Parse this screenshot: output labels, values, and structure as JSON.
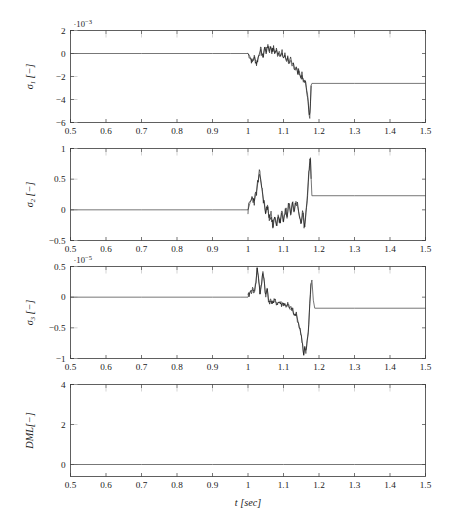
{
  "figure": {
    "xlabel": "t [sec]",
    "x_axis": {
      "label_symbol": "t",
      "label_unit": "[sec]",
      "min": 0.5,
      "max": 1.5,
      "ticks": [
        0.5,
        0.6,
        0.7,
        0.8,
        0.9,
        1,
        1.1,
        1.2,
        1.3,
        1.4,
        1.5
      ],
      "ticklabels": [
        "0.5",
        "0.6",
        "0.7",
        "0.8",
        "0.9",
        "1",
        "1.1",
        "1.2",
        "1.3",
        "1.4",
        "1.5"
      ]
    },
    "panels": [
      {
        "id": "panel-sigma1",
        "ylabel_symbol": "σ1",
        "ylabel_unit": "[−]",
        "multiplier": "·10",
        "multiplier_exp": "−3",
        "yticks": [
          2,
          0,
          -2,
          -4,
          -6
        ],
        "yticklabels": [
          "2",
          "0",
          "−2",
          "−4",
          "−6"
        ],
        "ymin": -6,
        "ymax": 2
      },
      {
        "id": "panel-sigma2",
        "ylabel_symbol": "σ2",
        "ylabel_unit": "[−]",
        "multiplier": "",
        "multiplier_exp": "",
        "yticks": [
          1,
          0.5,
          0,
          -0.5
        ],
        "yticklabels": [
          "1",
          "0.5",
          "0",
          "−0.5"
        ],
        "ymin": -0.5,
        "ymax": 1
      },
      {
        "id": "panel-sigma3",
        "ylabel_symbol": "σ3",
        "ylabel_unit": "[−]",
        "multiplier": "·10",
        "multiplier_exp": "−5",
        "yticks": [
          0.5,
          0,
          -0.5,
          -1
        ],
        "yticklabels": [
          "0.5",
          "0",
          "−0.5",
          "−1"
        ],
        "ymin": -1,
        "ymax": 0.5
      },
      {
        "id": "panel-dml",
        "ylabel_symbol": "DML",
        "ylabel_unit": "[−]",
        "multiplier": "",
        "multiplier_exp": "",
        "yticks": [
          4,
          2,
          0
        ],
        "yticklabels": [
          "4",
          "2",
          "0"
        ],
        "ymin": -0.6,
        "ymax": 4
      }
    ]
  },
  "chart_data": [
    {
      "type": "line",
      "title": "",
      "xlabel": "t [sec]",
      "ylabel": "sigma_1 [-]",
      "y_multiplier": 0.001,
      "xlim": [
        0.5,
        1.5
      ],
      "ylim": [
        -6,
        2
      ],
      "grid": false,
      "legend": null,
      "series": [
        {
          "name": "sigma_1",
          "x": [
            0.5,
            0.6,
            0.7,
            0.8,
            0.9,
            0.95,
            1.0,
            1.005,
            1.012,
            1.018,
            1.024,
            1.03,
            1.036,
            1.042,
            1.047,
            1.052,
            1.056,
            1.06,
            1.064,
            1.068,
            1.072,
            1.076,
            1.08,
            1.084,
            1.088,
            1.092,
            1.096,
            1.1,
            1.104,
            1.108,
            1.112,
            1.116,
            1.12,
            1.124,
            1.128,
            1.132,
            1.136,
            1.14,
            1.144,
            1.148,
            1.152,
            1.156,
            1.16,
            1.164,
            1.168,
            1.17,
            1.172,
            1.174,
            1.176,
            1.178,
            1.18,
            1.2,
            1.3,
            1.4,
            1.5
          ],
          "y": [
            0,
            0,
            0,
            0,
            0,
            0,
            0,
            -0.25,
            -0.75,
            -0.3,
            -0.9,
            -0.2,
            0.35,
            -0.35,
            0.55,
            0.1,
            0.8,
            0.2,
            0.6,
            0.15,
            0.45,
            0.05,
            0.3,
            -0.1,
            0.2,
            -0.25,
            0.05,
            -0.4,
            -0.15,
            -0.6,
            -0.35,
            -0.85,
            -0.6,
            -1.1,
            -0.85,
            -1.4,
            -1.15,
            -1.75,
            -1.5,
            -2.1,
            -1.9,
            -2.5,
            -2.3,
            -2.95,
            -3.6,
            -4.5,
            -5.3,
            -5.65,
            -4.2,
            -2.75,
            -2.6,
            -2.6,
            -2.6,
            -2.6,
            -2.6
          ]
        }
      ]
    },
    {
      "type": "line",
      "title": "",
      "xlabel": "t [sec]",
      "ylabel": "sigma_2 [-]",
      "y_multiplier": 1,
      "xlim": [
        0.5,
        1.5
      ],
      "ylim": [
        -0.5,
        1
      ],
      "grid": false,
      "legend": null,
      "series": [
        {
          "name": "sigma_2",
          "x": [
            0.5,
            0.6,
            0.7,
            0.8,
            0.9,
            0.98,
            1.0,
            1.006,
            1.012,
            1.018,
            1.024,
            1.028,
            1.032,
            1.036,
            1.04,
            1.045,
            1.05,
            1.055,
            1.06,
            1.065,
            1.07,
            1.075,
            1.08,
            1.085,
            1.09,
            1.095,
            1.1,
            1.105,
            1.11,
            1.115,
            1.12,
            1.125,
            1.13,
            1.135,
            1.14,
            1.145,
            1.15,
            1.155,
            1.158,
            1.162,
            1.166,
            1.17,
            1.173,
            1.176,
            1.178,
            1.18,
            1.2,
            1.3,
            1.4,
            1.5
          ],
          "y": [
            0,
            0,
            0,
            0,
            0,
            0,
            0,
            0.12,
            0.2,
            0.15,
            0.3,
            0.45,
            0.58,
            0.5,
            0.3,
            0.12,
            -0.05,
            0.08,
            -0.18,
            -0.02,
            -0.3,
            -0.12,
            -0.26,
            -0.08,
            -0.22,
            -0.05,
            -0.2,
            0.02,
            -0.14,
            0.1,
            -0.06,
            0.12,
            -0.02,
            0.14,
            0.05,
            -0.1,
            -0.22,
            -0.05,
            -0.3,
            -0.12,
            0.15,
            0.45,
            0.72,
            0.85,
            0.5,
            0.23,
            0.23,
            0.23,
            0.23,
            0.23
          ]
        }
      ]
    },
    {
      "type": "line",
      "title": "",
      "xlabel": "t [sec]",
      "ylabel": "sigma_3 [-]",
      "y_multiplier": 1e-05,
      "xlim": [
        0.5,
        1.5
      ],
      "ylim": [
        -1,
        0.5
      ],
      "grid": false,
      "legend": null,
      "series": [
        {
          "name": "sigma_3",
          "x": [
            0.5,
            0.6,
            0.7,
            0.8,
            0.9,
            0.98,
            1.0,
            1.006,
            1.012,
            1.018,
            1.022,
            1.026,
            1.03,
            1.034,
            1.038,
            1.042,
            1.046,
            1.05,
            1.054,
            1.058,
            1.062,
            1.066,
            1.07,
            1.076,
            1.082,
            1.088,
            1.094,
            1.1,
            1.106,
            1.112,
            1.118,
            1.124,
            1.13,
            1.136,
            1.142,
            1.146,
            1.15,
            1.154,
            1.157,
            1.16,
            1.163,
            1.166,
            1.17,
            1.174,
            1.177,
            1.18,
            1.184,
            1.188,
            1.2,
            1.3,
            1.4,
            1.5
          ],
          "y": [
            0,
            0,
            0,
            0,
            0,
            0,
            0,
            0.08,
            0.12,
            0.1,
            0.22,
            0.48,
            0.3,
            0.05,
            0.2,
            0.42,
            0.25,
            0.0,
            0.15,
            -0.05,
            -0.08,
            -0.06,
            -0.09,
            -0.07,
            -0.1,
            -0.08,
            -0.12,
            -0.1,
            -0.14,
            -0.12,
            -0.2,
            -0.18,
            -0.3,
            -0.28,
            -0.42,
            -0.52,
            -0.62,
            -0.78,
            -0.95,
            -0.82,
            -0.92,
            -0.75,
            -0.58,
            -0.1,
            0.2,
            0.28,
            -0.05,
            -0.18,
            -0.18,
            -0.18,
            -0.18,
            -0.18
          ]
        }
      ]
    },
    {
      "type": "line",
      "title": "",
      "xlabel": "t [sec]",
      "ylabel": "DML [-]",
      "y_multiplier": 1,
      "xlim": [
        0.5,
        1.5
      ],
      "ylim": [
        -0.6,
        4
      ],
      "grid": false,
      "legend": null,
      "series": [
        {
          "name": "DML",
          "x": [
            0.5,
            0.6,
            0.7,
            0.8,
            0.9,
            1.0,
            1.1,
            1.2,
            1.3,
            1.4,
            1.5
          ],
          "y": [
            0,
            0,
            0,
            0,
            0,
            0,
            0,
            0,
            0,
            0,
            0
          ]
        }
      ]
    }
  ]
}
